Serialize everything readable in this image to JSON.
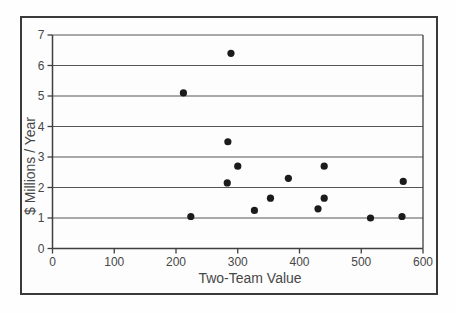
{
  "figure": {
    "background": "#fdfdfd",
    "frame_color": "#3a3a3a"
  },
  "chart_data": {
    "type": "scatter",
    "title": "",
    "xlabel": "Two-Team Value",
    "ylabel": "$ Millions / Year",
    "xlim": [
      0,
      600
    ],
    "ylim": [
      0,
      7
    ],
    "xticks": [
      0,
      100,
      200,
      300,
      400,
      500,
      600
    ],
    "yticks": [
      0,
      1,
      2,
      3,
      4,
      5,
      6,
      7
    ],
    "grid": "horizontal-only",
    "legend": "none",
    "marker": {
      "shape": "circle",
      "color": "#1b1b1b",
      "radius_px": 3.6
    },
    "colors": {
      "grid": "#565656",
      "axis": "#3f3f3f",
      "text": "#474747"
    },
    "points": [
      [
        212,
        5.1
      ],
      [
        224,
        1.05
      ],
      [
        283,
        2.15
      ],
      [
        284,
        3.5
      ],
      [
        289,
        6.4
      ],
      [
        300,
        2.7
      ],
      [
        327,
        1.25
      ],
      [
        353,
        1.65
      ],
      [
        382,
        2.3
      ],
      [
        430,
        1.3
      ],
      [
        440,
        1.65
      ],
      [
        440,
        2.7
      ],
      [
        515,
        1.0
      ],
      [
        566,
        1.05
      ],
      [
        568,
        2.2
      ]
    ]
  }
}
